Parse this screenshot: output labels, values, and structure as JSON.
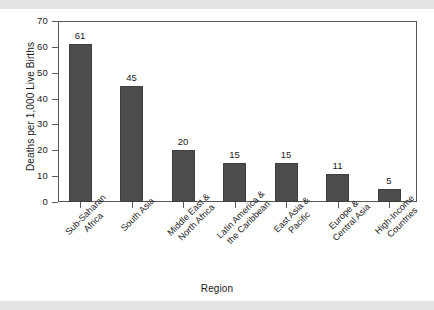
{
  "chart_data": {
    "type": "bar",
    "title": "",
    "xlabel": "Region",
    "ylabel": "Deaths per 1,000 Live Births",
    "ylim": [
      0,
      70
    ],
    "yticks": [
      0,
      10,
      20,
      30,
      40,
      50,
      60,
      70
    ],
    "ytick_labels": [
      "0",
      "10",
      "20",
      "30",
      "40",
      "50",
      "60",
      "70"
    ],
    "grid": false,
    "legend": null,
    "bar_color": "#4c4c4c",
    "frame_color": "#595959",
    "value_labels_shown": true,
    "categories": [
      "Sub-Saharan\nAfrica",
      "South Asia",
      "Middle East &\nNorth Africa",
      "Latin America &\nthe Caribbean",
      "East Asia &\nPacific",
      "Europe &\nCentral Asia",
      "High-Income\nCountries"
    ],
    "values": [
      61,
      45,
      20,
      15,
      15,
      11,
      5
    ],
    "value_text": [
      "61",
      "45",
      "20",
      "15",
      "15",
      "11",
      "5"
    ]
  }
}
